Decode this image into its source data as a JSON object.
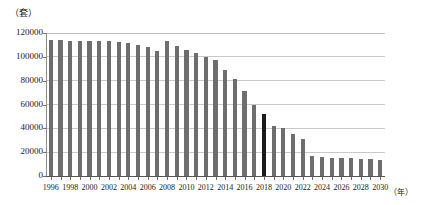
{
  "chart_data": {
    "type": "bar",
    "title": "",
    "subtitle": "",
    "xlabel": "（年）",
    "ylabel": "（套）",
    "ylim": [
      0,
      120000
    ],
    "ytick_labels": [
      "0",
      "20000",
      "40000",
      "60000",
      "80000",
      "100000",
      "120000"
    ],
    "ytick_values": [
      0,
      20000,
      40000,
      60000,
      80000,
      100000,
      120000
    ],
    "grid": true,
    "legend": null,
    "xtick_label_step": 2,
    "xtick_labels": [
      "1996",
      "1998",
      "2000",
      "2002",
      "2004",
      "2006",
      "2008",
      "2010",
      "2012",
      "2014",
      "2016",
      "2018",
      "2020",
      "2022",
      "2024",
      "2026",
      "2028",
      "2030"
    ],
    "categories": [
      "1996",
      "1997",
      "1998",
      "1999",
      "2000",
      "2001",
      "2002",
      "2003",
      "2004",
      "2005",
      "2006",
      "2007",
      "2008",
      "2009",
      "2010",
      "2011",
      "2012",
      "2013",
      "2014",
      "2015",
      "2016",
      "2017",
      "2018",
      "2019",
      "2020",
      "2021",
      "2022",
      "2023",
      "2024",
      "2025",
      "2026",
      "2027",
      "2028",
      "2029",
      "2030"
    ],
    "values": [
      114000,
      114000,
      113500,
      113500,
      113000,
      113000,
      113000,
      112500,
      112000,
      110000,
      108000,
      105000,
      113000,
      109000,
      106000,
      103000,
      100000,
      97000,
      89000,
      81000,
      71000,
      60000,
      52000,
      42000,
      40000,
      35000,
      31000,
      17000,
      16000,
      15500,
      15500,
      15000,
      14500,
      14000,
      13500
    ],
    "bar_color": "#6e6e6e",
    "highlight_color": "#1a1a1a",
    "highlight_index": 22,
    "highlight_category": "2018"
  }
}
